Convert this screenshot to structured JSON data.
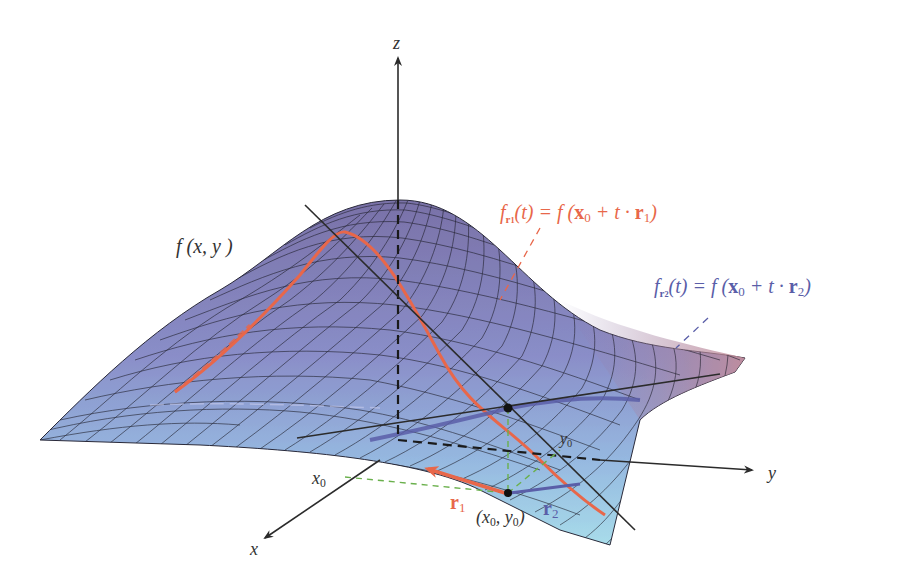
{
  "figure": {
    "colors": {
      "background": "#ffffff",
      "axis": "#2b2b2b",
      "surface_low": "#a8d8ea",
      "surface_mid": "#8a8ec8",
      "surface_high": "#7a72a8",
      "surface_far_edge": "#c48a96",
      "grid": "#1e1e2a",
      "r1_color": "#e8674a",
      "r2_color": "#5a5ea8",
      "projection_dash": "#6ab04c"
    }
  },
  "axes": {
    "z_label": "z",
    "y_label": "y",
    "x_label": "x"
  },
  "labels": {
    "surface": "f (x, y )",
    "fr1_lhs_f": "f",
    "fr1_lhs_sub": "r",
    "fr1_lhs_subsub": "1",
    "fr1_rhs": "(t) = f (",
    "fr1_x0": "x",
    "fr1_x0_sub": "0",
    "fr1_plus": " + t · ",
    "fr1_r": "r",
    "fr1_r_sub": "1",
    "fr1_close": ")",
    "fr2_lhs_f": "f",
    "fr2_lhs_sub": "r",
    "fr2_lhs_subsub": "2",
    "fr2_rhs": "(t) = f (",
    "fr2_x0": "x",
    "fr2_x0_sub": "0",
    "fr2_plus": " + t · ",
    "fr2_r": "r",
    "fr2_r_sub": "2",
    "fr2_close": ")",
    "x0": "x",
    "x0_sub": "0",
    "y0": "y",
    "y0_sub": "0",
    "point": "(x",
    "point_sub1": "0",
    "point_mid": ", y",
    "point_sub2": "0",
    "point_close": ")",
    "r1": "r",
    "r1_sub": "1",
    "r2": "r",
    "r2_sub": "2"
  }
}
